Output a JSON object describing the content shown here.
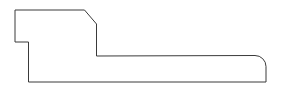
{
  "canvas": {
    "width": 281,
    "height": 94,
    "background_color": "#ffffff",
    "title": "Profile Outline Drawing"
  },
  "drawing": {
    "name": "molding-profile-cross-section",
    "description": "Closed polygonal outline of a trim/molding profile cross-section with a stepped notch at upper left, a chamfered corner at upper right, and a rounded corner at lower right.",
    "stroke_color": "#3a3a3a",
    "fill_color": "#ffffff",
    "stroke_width": 1,
    "units": "px",
    "path_d": "M 15 10 L 84.5 10 L 96.5 24 L 96.5 56 L 255 55.5 A 11 11 0 0 1 266 66.5 L 266 82 L 28.5 82 L 28.5 42 L 15 42 Z",
    "vertices": [
      {
        "id": "v1",
        "label": "top-left-corner",
        "x": 15,
        "y": 10,
        "type": "corner"
      },
      {
        "id": "v2",
        "label": "top-right-chamfer-start",
        "x": 84.5,
        "y": 10,
        "type": "corner"
      },
      {
        "id": "v3",
        "label": "top-right-chamfer-end",
        "x": 96.5,
        "y": 24,
        "type": "corner"
      },
      {
        "id": "v4",
        "label": "inner-step-corner",
        "x": 96.5,
        "y": 56,
        "type": "corner"
      },
      {
        "id": "v5",
        "label": "fillet-start",
        "x": 255,
        "y": 55.5,
        "type": "arc-start"
      },
      {
        "id": "v6",
        "label": "fillet-end",
        "x": 266,
        "y": 66.5,
        "type": "arc-end"
      },
      {
        "id": "v7",
        "label": "bottom-right-corner",
        "x": 266,
        "y": 82,
        "type": "corner"
      },
      {
        "id": "v8",
        "label": "bottom-left-corner",
        "x": 28.5,
        "y": 82,
        "type": "corner"
      },
      {
        "id": "v9",
        "label": "notch-bottom-corner",
        "x": 28.5,
        "y": 42,
        "type": "corner"
      },
      {
        "id": "v10",
        "label": "notch-left-corner",
        "x": 15,
        "y": 42,
        "type": "corner"
      }
    ],
    "segments": [
      {
        "id": "s1",
        "label": "top-edge",
        "from": "v1",
        "to": "v2",
        "kind": "line"
      },
      {
        "id": "s2",
        "label": "chamfer-edge",
        "from": "v2",
        "to": "v3",
        "kind": "line"
      },
      {
        "id": "s3",
        "label": "upper-right-vertical-edge",
        "from": "v3",
        "to": "v4",
        "kind": "line"
      },
      {
        "id": "s4",
        "label": "shelf-edge",
        "from": "v4",
        "to": "v5",
        "kind": "line"
      },
      {
        "id": "s5",
        "label": "rounded-corner-fillet",
        "from": "v5",
        "to": "v6",
        "kind": "arc",
        "radius": 11
      },
      {
        "id": "s6",
        "label": "right-vertical-edge",
        "from": "v6",
        "to": "v7",
        "kind": "line"
      },
      {
        "id": "s7",
        "label": "bottom-edge",
        "from": "v7",
        "to": "v8",
        "kind": "line"
      },
      {
        "id": "s8",
        "label": "notch-vertical-edge",
        "from": "v8",
        "to": "v9",
        "kind": "line"
      },
      {
        "id": "s9",
        "label": "notch-horizontal-edge",
        "from": "v9",
        "to": "v10",
        "kind": "line"
      },
      {
        "id": "s10",
        "label": "left-vertical-edge",
        "from": "v10",
        "to": "v1",
        "kind": "line"
      }
    ]
  }
}
